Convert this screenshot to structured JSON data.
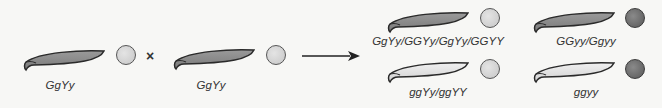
{
  "diagram": {
    "cross_symbol": "×",
    "parents": [
      {
        "genotype": "GgYy",
        "pod_color": "green",
        "seed_color": "yellow"
      },
      {
        "genotype": "GgYy",
        "pod_color": "green",
        "seed_color": "yellow"
      }
    ],
    "offspring": [
      {
        "genotype": "GgYy/GGYy/GgYy/GGYY",
        "pod_color": "green",
        "seed_color": "yellow"
      },
      {
        "genotype": "GGyy/Ggyy",
        "pod_color": "green",
        "seed_color": "green"
      },
      {
        "genotype": "ggYy/ggYY",
        "pod_color": "yellow",
        "seed_color": "yellow"
      },
      {
        "genotype": "ggyy",
        "pod_color": "yellow",
        "seed_color": "green"
      }
    ],
    "colors": {
      "green_pod": "#8c8c8c",
      "yellow_pod": "#e2e2e2",
      "yellow_seed": "#d4d4d4",
      "green_seed": "#6e6e6e",
      "outline": "#2a2a2a"
    }
  }
}
